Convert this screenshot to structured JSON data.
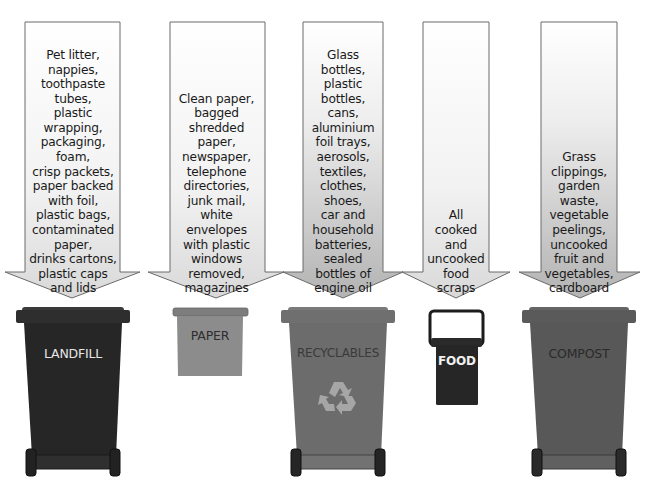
{
  "diagram": {
    "type": "waste-sorting-guide",
    "columns": [
      {
        "id": "landfill",
        "bin_label": "LANDFILL",
        "bin_color": "#2b2b2b",
        "label_color": "#e6e6e6",
        "arrow_style": "light",
        "items_text": [
          "Pet litter,",
          "nappies,",
          "toothpaste",
          "tubes,",
          "plastic",
          "wrapping,",
          "packaging,",
          "foam,",
          "crisp packets,",
          "paper backed",
          "with foil,",
          "plastic bags,",
          "contaminated",
          "paper,",
          "drinks cartons,",
          "plastic caps",
          "and lids"
        ]
      },
      {
        "id": "paper",
        "bin_label": "PAPER",
        "bin_color": "#8a8a8a",
        "label_color": "#2e2e2e",
        "arrow_style": "light",
        "items_text": [
          "Clean paper,",
          "bagged",
          "shredded",
          "paper,",
          "newspaper,",
          "telephone",
          "directories,",
          "junk mail,",
          "white",
          "envelopes",
          "with plastic",
          "windows",
          "removed,",
          "magazines"
        ]
      },
      {
        "id": "recyclables",
        "bin_label": "RECYCLABLES",
        "bin_color": "#6e6e6e",
        "label_color": "#3a3a3a",
        "icon": "recycle-icon",
        "arrow_style": "gradient",
        "items_text": [
          "Glass",
          "bottles,",
          "plastic",
          "bottles,",
          "cans,",
          "aluminium",
          "foil trays,",
          "aerosols,",
          "textiles,",
          "clothes,",
          "shoes,",
          "car and",
          "household",
          "batteries,",
          "sealed",
          "bottles of",
          "engine oil"
        ]
      },
      {
        "id": "food",
        "bin_label": "FOOD",
        "bin_color": "#2b2b2b",
        "label_color": "#f0f0f0",
        "arrow_style": "light",
        "items_text": [
          "All",
          "cooked",
          "and",
          "uncooked",
          "food",
          "scraps"
        ]
      },
      {
        "id": "compost",
        "bin_label": "COMPOST",
        "bin_color": "#5e5e5e",
        "label_color": "#2a2a2a",
        "arrow_style": "gradient",
        "items_text": [
          "Grass",
          "clippings,",
          "garden",
          "waste,",
          "vegetable",
          "peelings,",
          "uncooked",
          "fruit and",
          "vegetables,",
          "cardboard"
        ]
      }
    ]
  }
}
